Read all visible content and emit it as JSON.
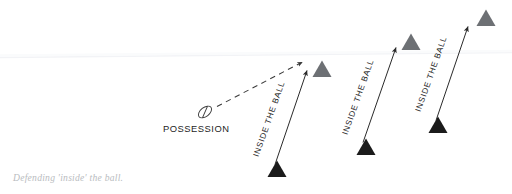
{
  "figure": {
    "caption": "Defending 'inside' the ball.",
    "possession_label": "POSSESSION",
    "ball_icon": "rugby-ball-icon",
    "horizon_line": {
      "visible": true,
      "color": "#f4f5f7",
      "x1": 0,
      "y1": 57,
      "x2": 512,
      "y2": 53
    },
    "colors": {
      "attacker_triangle": "#1b1b1b",
      "defender_triangle": "#6d7074",
      "arrow": "#2a2a2a",
      "dashed_arrow": "#3a3a3a",
      "label_text": "#1d1d1d",
      "caption_text": "#b9bcc0",
      "background": "#ffffff"
    },
    "ball": {
      "x": 205,
      "y": 112,
      "rx": 7.4,
      "ry": 4.6,
      "rotation": -38
    },
    "pass_arrow": {
      "label": "pass-direction",
      "style": "dashed",
      "x1": 216,
      "y1": 107,
      "x2": 303,
      "y2": 62
    },
    "groups": [
      {
        "label": "INSIDE THE BALL",
        "attacker": {
          "x": 277,
          "y": 172,
          "size": 17
        },
        "defender": {
          "x": 322,
          "y": 74,
          "size": 17
        },
        "arrow": {
          "x1": 274,
          "y1": 166,
          "x2": 306,
          "y2": 71
        },
        "label_pos": {
          "x": 255,
          "y": 150,
          "rotation": -70
        }
      },
      {
        "label": "INSIDE THE BALL",
        "attacker": {
          "x": 366,
          "y": 150,
          "size": 17
        },
        "defender": {
          "x": 411,
          "y": 46,
          "size": 17
        },
        "arrow": {
          "x1": 362,
          "y1": 144,
          "x2": 395,
          "y2": 50
        },
        "label_pos": {
          "x": 344,
          "y": 128,
          "rotation": -70
        }
      },
      {
        "label": "INSIDE THE BALL",
        "attacker": {
          "x": 438,
          "y": 128,
          "size": 17
        },
        "defender": {
          "x": 486,
          "y": 22,
          "size": 17
        },
        "arrow": {
          "x1": 436,
          "y1": 122,
          "x2": 468,
          "y2": 30
        },
        "label_pos": {
          "x": 417,
          "y": 105,
          "rotation": -70
        }
      }
    ]
  }
}
